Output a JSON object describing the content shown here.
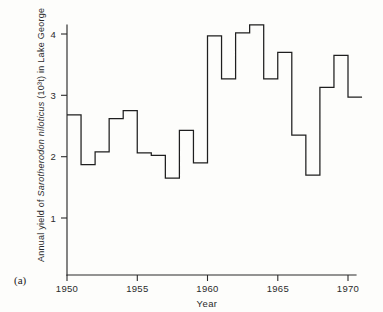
{
  "figure": {
    "panel_label": "(a)"
  },
  "chart_data": {
    "type": "line",
    "subtype": "step",
    "title": "",
    "xlabel": "Year",
    "ylabel": "Annual yield of Sarotherodon niloticus (10³ t) in Lake George",
    "ylabel_parts": {
      "prefix": "Annual yield of ",
      "species": "Sarotherodon niloticus",
      "suffix": " (10³t) in Lake George"
    },
    "x": [
      1950,
      1951,
      1952,
      1953,
      1954,
      1955,
      1956,
      1957,
      1958,
      1959,
      1960,
      1961,
      1962,
      1963,
      1964,
      1965,
      1966,
      1967,
      1968,
      1969,
      1970
    ],
    "values": [
      2.68,
      1.87,
      2.08,
      2.62,
      2.75,
      2.06,
      2.02,
      1.65,
      2.43,
      1.9,
      3.97,
      3.27,
      4.02,
      4.15,
      3.27,
      3.7,
      2.35,
      1.7,
      3.13,
      3.65,
      2.97
    ],
    "xlim": [
      1950,
      1970.5
    ],
    "ylim": [
      0,
      4.45
    ],
    "xticks": [
      1950,
      1955,
      1960,
      1965,
      1970
    ],
    "xticklabels": [
      "1950",
      "1955",
      "1960",
      "1965",
      "1970"
    ],
    "yticks": [
      1,
      2,
      3,
      4
    ],
    "yticklabels": [
      "1",
      "2",
      "3",
      "4"
    ],
    "grid": false,
    "legend": null,
    "line_color": "#1f1f1f",
    "axis_color": "#2b2b2b"
  }
}
